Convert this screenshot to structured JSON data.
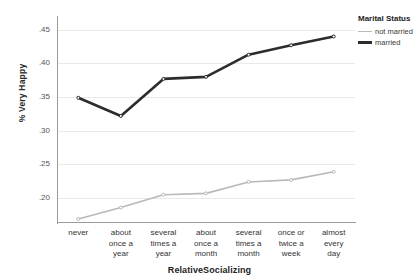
{
  "chart_data": {
    "type": "line",
    "title": "",
    "xlabel": "RelativeSocializing",
    "ylabel": "% Very Happy",
    "categories": [
      "never",
      "about once a year",
      "several times a year",
      "about once a month",
      "several times a month",
      "once or twice a week",
      "almost every day"
    ],
    "category_lines": [
      [
        "never"
      ],
      [
        "about",
        "once a",
        "year"
      ],
      [
        "several",
        "times a",
        "year"
      ],
      [
        "about",
        "once a",
        "month"
      ],
      [
        "several",
        "times a",
        "month"
      ],
      [
        "once or",
        "twice a",
        "week"
      ],
      [
        "almost",
        "every",
        "day"
      ]
    ],
    "series": [
      {
        "name": "not married",
        "color": "#b9b9b9",
        "width": 1.6,
        "values": [
          0.169,
          0.186,
          0.205,
          0.207,
          0.224,
          0.227,
          0.239
        ]
      },
      {
        "name": "married",
        "color": "#2c2c2c",
        "width": 2.6,
        "values": [
          0.349,
          0.322,
          0.377,
          0.38,
          0.413,
          0.427,
          0.44
        ]
      }
    ],
    "ylim": [
      0.163,
      0.463
    ],
    "yticks": [
      0.2,
      0.25,
      0.3,
      0.35,
      0.4,
      0.45
    ],
    "ytick_labels": [
      ".20",
      ".25",
      ".30",
      ".35",
      ".40",
      ".45"
    ],
    "grid": true,
    "legend_position": "right",
    "legend_title": "Marital Status"
  },
  "legend": {
    "title": "Marital Status",
    "entries": [
      {
        "label": "not married",
        "color": "#b9b9b9"
      },
      {
        "label": "married",
        "color": "#2c2c2c"
      }
    ]
  },
  "axes": {
    "y_title": "% Very Happy",
    "x_title": "RelativeSocializing"
  }
}
